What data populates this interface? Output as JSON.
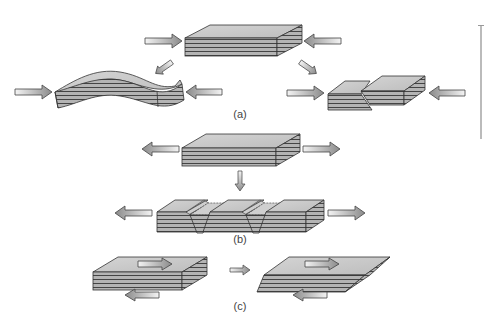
{
  "diagram": {
    "panels": [
      {
        "id": "a",
        "label": "(a)",
        "description": "Compression: flat layered slab squeezed from both sides deforms into a fold (left) or a reverse fault (right)",
        "forces": "compressional",
        "outcomes": [
          "fold",
          "reverse-fault"
        ]
      },
      {
        "id": "b",
        "label": "(b)",
        "description": "Tension: layered slab pulled apart forms normal faults with down-dropped blocks",
        "forces": "tensional",
        "outcomes": [
          "normal-faults"
        ]
      },
      {
        "id": "c",
        "label": "(c)",
        "description": "Shear: opposing forces on top and bottom of slab produce a sheared, skewed block",
        "forces": "shear",
        "outcomes": [
          "sheared-block"
        ]
      }
    ],
    "colors": {
      "slab_top": "#c8c8c8",
      "slab_layers": "#a8a8a8",
      "outline": "#333333",
      "arrow_light": "#f0f0f0",
      "arrow_dark": "#8a8a8a"
    }
  }
}
